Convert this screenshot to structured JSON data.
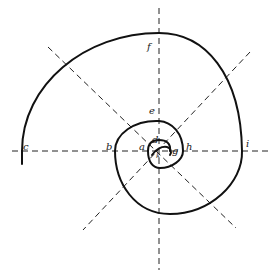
{
  "diagram": {
    "type": "spiral-construction",
    "colors": {
      "background": "#ffffff",
      "ink": "#111111"
    },
    "center": {
      "x": 159,
      "y": 151
    },
    "axes": [
      {
        "name": "horizontal",
        "x1": 12,
        "y1": 151,
        "x2": 270,
        "y2": 151
      },
      {
        "name": "vertical",
        "x1": 159,
        "y1": 8,
        "x2": 159,
        "y2": 270
      },
      {
        "name": "diagonal-nw-se",
        "x1": 48,
        "y1": 47,
        "x2": 236,
        "y2": 228
      },
      {
        "name": "diagonal-ne-sw",
        "x1": 250,
        "y1": 52,
        "x2": 83,
        "y2": 230
      }
    ],
    "labels": [
      {
        "id": "a",
        "text": "a",
        "x": 139,
        "y": 151
      },
      {
        "id": "b",
        "text": "b",
        "x": 106,
        "y": 151
      },
      {
        "id": "c",
        "text": "c",
        "x": 23,
        "y": 150
      },
      {
        "id": "d",
        "text": "d",
        "x": 153,
        "y": 143
      },
      {
        "id": "e",
        "text": "e",
        "x": 150,
        "y": 113
      },
      {
        "id": "f",
        "text": "f",
        "x": 148,
        "y": 48
      },
      {
        "id": "g",
        "text": "g",
        "x": 172,
        "y": 154
      },
      {
        "id": "h",
        "text": "h",
        "x": 186,
        "y": 151
      },
      {
        "id": "i",
        "text": "i",
        "x": 246,
        "y": 147
      },
      {
        "id": "k",
        "text": "k",
        "x": 158,
        "y": 156
      }
    ]
  }
}
